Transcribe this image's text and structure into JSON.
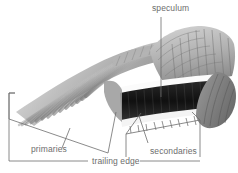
{
  "figure": {
    "width": 238,
    "height": 173,
    "background_color": "#ffffff",
    "line_color": "#6d6d6d",
    "text_color": "#6d6d6d"
  },
  "labels": {
    "speculum": "speculum",
    "primaries": "primaries",
    "trailing_edge": "trailing edge",
    "secondaries": "secondaries"
  },
  "illustration": {
    "description": "grayscale shaded drawing of an outstretched bird wing seen from above",
    "parts": [
      "primary flight feathers",
      "secondary flight feathers",
      "speculum band",
      "covert feathers"
    ],
    "palette": {
      "lightest": "#f2f2f2",
      "light": "#cfcfcf",
      "mid": "#a8a8a8",
      "dark": "#6f6f6f",
      "darkest": "#1a1a1a",
      "speculum_white": "#fbfbfb",
      "speculum_black": "#141414"
    }
  }
}
